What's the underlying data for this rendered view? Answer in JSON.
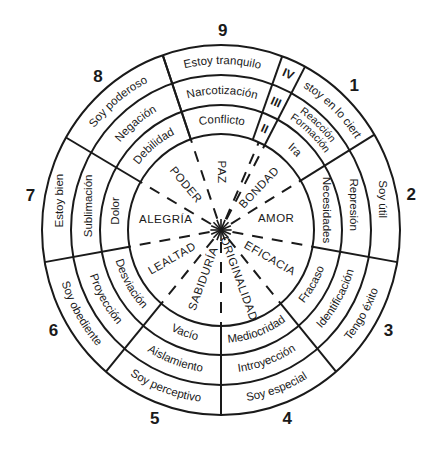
{
  "diagram": {
    "center": [
      221,
      230
    ],
    "radii": {
      "r1": 94,
      "r2": 123,
      "r3": 153,
      "r4": 184
    },
    "colors": {
      "ink": "#1a1a1a",
      "background": "#ffffff"
    },
    "sectors": [
      {
        "number": "9",
        "start": -19,
        "end": 20,
        "ring4": "Estoy tranquilo",
        "ring3": "Narcotización",
        "ring2": "Conflicto",
        "virtue": "PAZ"
      },
      {
        "number": "1",
        "start": 28,
        "end": 59,
        "ring4": "Estoy en lo cierto",
        "ring3": "Reacción Formación",
        "ring2": "Ira",
        "virtue": "BONDAD"
      },
      {
        "number": "2",
        "start": 59,
        "end": 100,
        "ring4": "Soy útil",
        "ring3": "Represión",
        "ring2": "Necesidades",
        "virtue": "AMOR"
      },
      {
        "number": "3",
        "start": 100,
        "end": 140,
        "ring4": "Tengo éxito",
        "ring3": "Identificación",
        "ring2": "Fracaso",
        "virtue": "EFICACIA"
      },
      {
        "number": "4",
        "start": 140,
        "end": 180,
        "ring4": "Soy especial",
        "ring3": "Introyección",
        "ring2": "Mediocridad",
        "virtue": "ORIGINALIDAD"
      },
      {
        "number": "5",
        "start": 180,
        "end": 220,
        "ring4": "Soy perceptivo",
        "ring3": "Aislamiento",
        "ring2": "Vacío",
        "virtue": "SABIDURÍA"
      },
      {
        "number": "6",
        "start": 220,
        "end": 260,
        "ring4": "Soy obediente",
        "ring3": "Proyección",
        "ring2": "Desviación",
        "virtue": "LEALTAD"
      },
      {
        "number": "7",
        "start": 260,
        "end": 300,
        "ring4": "Estoy bien",
        "ring3": "Sublimación",
        "ring2": "Dolor",
        "virtue": "ALEGRÍA"
      },
      {
        "number": "8",
        "start": 300,
        "end": 341,
        "ring4": "Soy poderoso",
        "ring3": "Negación",
        "ring2": "Debilidad",
        "virtue": "PODER"
      }
    ],
    "level_strip": {
      "start": 20,
      "end": 28,
      "labels": [
        "IV",
        "III",
        "II"
      ]
    }
  }
}
